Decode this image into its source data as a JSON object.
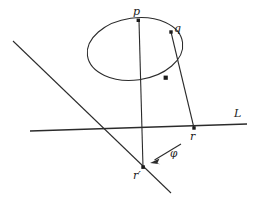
{
  "figure": {
    "kind": "geometry-diagram",
    "background_color": "#ffffff",
    "stroke_color": "#2b2b2b",
    "labels": {
      "p": "p",
      "q": "q",
      "line": "L",
      "r": "r",
      "r_prime": "r′",
      "phi": "φ"
    },
    "points": [
      {
        "name": "p",
        "x": 139,
        "y": 21
      },
      {
        "name": "q",
        "x": 171,
        "y": 32
      },
      {
        "name": "intersection",
        "x": 166,
        "y": 78
      },
      {
        "name": "r",
        "x": 194,
        "y": 128
      },
      {
        "name": "r-prime",
        "x": 143,
        "y": 167
      }
    ],
    "curves": {
      "ellipse": {
        "cx": 135,
        "cy": 49,
        "rx": 48,
        "ry": 31,
        "rotation_deg": -8
      },
      "line_L": {
        "x1": 30,
        "y1": 131,
        "x2": 247,
        "y2": 124
      },
      "diagonal": {
        "x1": 13,
        "y1": 41,
        "x2": 171,
        "y2": 193
      },
      "segment_p_rprime": {
        "x1": 139,
        "y1": 21,
        "x2": 143,
        "y2": 167
      },
      "segment_q_r": {
        "x1": 171,
        "y1": 32,
        "x2": 194,
        "y2": 128
      }
    },
    "arrow": {
      "x1": 181,
      "y1": 144,
      "x2": 151,
      "y2": 162
    }
  }
}
